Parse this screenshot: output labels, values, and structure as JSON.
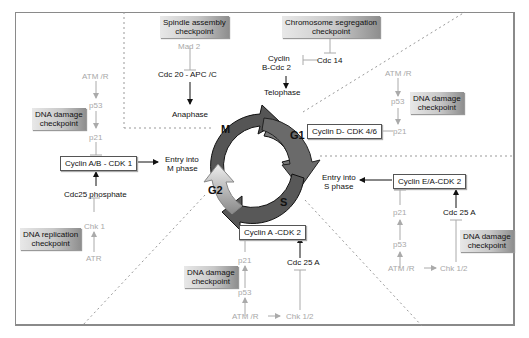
{
  "diagram": {
    "phases": [
      "M",
      "G1",
      "S",
      "G2"
    ],
    "checkpoints": {
      "spindle": "Spindle assembly\ncheckpoint",
      "chromosome": "Chromosome segregation\ncheckpoint",
      "dna_damage_left": "DNA damage\ncheckpoint",
      "dna_replication": "DNA replication\ncheckpoint",
      "dna_damage_g1": "DNA damage\ncheckpoint",
      "dna_damage_s_right": "DNA damage\ncheckpoint",
      "dna_damage_s_bottom": "DNA damage\ncheckpoint"
    },
    "complexes": {
      "cyclin_ab_cdk1": "Cyclin A/B - CDK 1",
      "cyclin_d_cdk46": "Cyclin D- CDK 4/6",
      "cyclin_ea_cdk2": "Cyclin E/A-CDK 2",
      "cyclin_a_cdk2": "Cyclin A -CDK 2"
    },
    "labels": {
      "mad2": "Mad 2",
      "cdc20_apcc": "Cdc 20 - APC /C",
      "anaphase": "Anaphase",
      "cyclin_b_cdc2_line1": "Cyclin",
      "cyclin_b_cdc2_line2": "B-Cdc 2",
      "cdc14": "Cdc 14",
      "telophase": "Telophase",
      "atm_r_left": "ATM /R",
      "p53_left": "p53",
      "p21_left": "p21",
      "entry_m_line1": "Entry into",
      "entry_m_line2": "M phase",
      "cdc25_phosphate": "Cdc25 phosphate",
      "chk1": "Chk 1",
      "atr": "ATR",
      "atm_r_g1": "ATM /R",
      "p53_g1": "p53",
      "p21_g1": "p21",
      "entry_s_line1": "Entry into",
      "entry_s_line2": "S phase",
      "p21_sr": "p21",
      "p53_sr": "p53",
      "atm_r_sr": "ATM /R",
      "chk12_sr": "Chk 1/2",
      "cdc25a_sr": "Cdc 25 A",
      "p21_sb": "p21",
      "p53_sb": "p53",
      "atm_r_sb": "ATM /R",
      "chk12_sb": "Chk 1/2",
      "cdc25a_sb": "Cdc 25 A"
    }
  }
}
